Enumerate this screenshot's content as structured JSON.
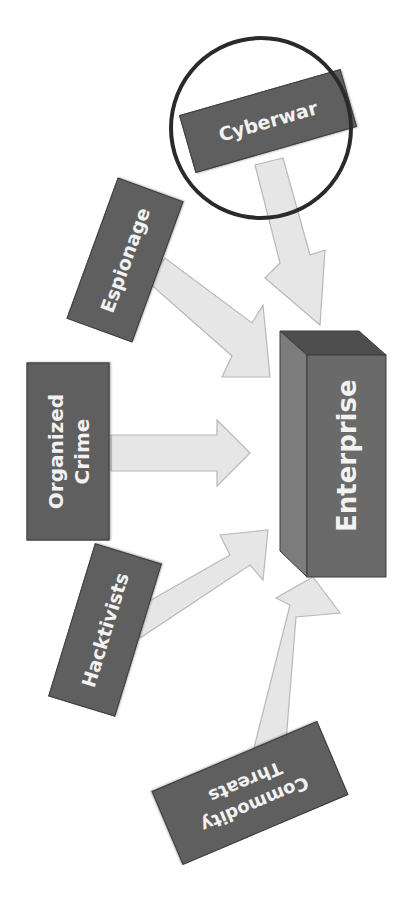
{
  "diagram": {
    "title": "",
    "center": {
      "label": "Enterprise",
      "shape": "3d-box"
    },
    "sources": [
      {
        "id": "cyberwar",
        "label": "Cyberwar",
        "highlighted": true
      },
      {
        "id": "espionage",
        "label": "Espionage",
        "highlighted": false
      },
      {
        "id": "organized-crime",
        "label": "Organized\nCrime",
        "highlighted": false
      },
      {
        "id": "hacktivists",
        "label": "Hacktivists",
        "highlighted": false
      },
      {
        "id": "commodity-threats",
        "label": "Commodity\nThreats",
        "highlighted": false
      }
    ],
    "arrows": [
      {
        "from": "cyberwar",
        "to": "enterprise"
      },
      {
        "from": "espionage",
        "to": "enterprise"
      },
      {
        "from": "organized-crime",
        "to": "enterprise"
      },
      {
        "from": "hacktivists",
        "to": "enterprise"
      },
      {
        "from": "commodity-threats",
        "to": "enterprise"
      }
    ],
    "colors": {
      "box_fill": "#5f5f5f",
      "box_text": "#f2f2f2",
      "arrow_fill": "#e6e6e6",
      "arrow_stroke": "#b8b8b8",
      "highlight_circle": "#2a2a2a",
      "enterprise_front": "#6a6a6a",
      "enterprise_side": "#7c7c7c",
      "enterprise_top": "#4e4e4e"
    }
  }
}
